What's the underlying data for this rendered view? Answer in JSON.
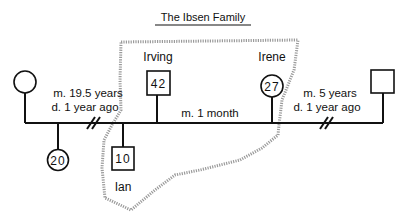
{
  "title": "The Ibsen Family",
  "people": {
    "left_female": {
      "name": "",
      "age": "",
      "sex": "female"
    },
    "right_male": {
      "name": "",
      "age": "",
      "sex": "male"
    },
    "daughter": {
      "name": "",
      "age": "20",
      "sex": "female"
    },
    "ian": {
      "name": "Ian",
      "age": "10",
      "sex": "male"
    },
    "irving": {
      "name": "Irving",
      "age": "42",
      "sex": "male"
    },
    "irene": {
      "name": "Irene",
      "age": "27",
      "sex": "female"
    }
  },
  "relationships": {
    "left": {
      "line1": "m. 19.5 years",
      "line2": "d. 1 year ago",
      "status": "divorced"
    },
    "center": {
      "line1": "m. 1 month",
      "status": "married"
    },
    "right": {
      "line1": "m. 5 years",
      "line2": "d. 1 year ago",
      "status": "divorced"
    }
  },
  "household_boundary": {
    "label": "household",
    "style": "dotted"
  },
  "colors": {
    "ink": "#111111",
    "boundary": "#9a9a9a",
    "background": "#ffffff"
  }
}
